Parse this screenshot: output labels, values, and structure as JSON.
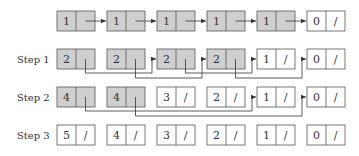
{
  "colors": {
    "shaded_fill": "#cfcfcf",
    "plain_fill": "#ffffff",
    "stroke": "#555555",
    "text": "#333333"
  },
  "layout": {
    "box_x": [
      57,
      107,
      157,
      207,
      257,
      307
    ],
    "box_width": 38,
    "box_height": 20,
    "row_y": [
      11,
      49,
      87,
      125
    ],
    "label_x": 17
  },
  "rows": [
    {
      "label": "",
      "nodes": [
        {
          "value": "1",
          "shaded": true,
          "null_ptr": false
        },
        {
          "value": "1",
          "shaded": true,
          "null_ptr": false
        },
        {
          "value": "1",
          "shaded": true,
          "null_ptr": false
        },
        {
          "value": "1",
          "shaded": true,
          "null_ptr": false
        },
        {
          "value": "1",
          "shaded": true,
          "null_ptr": false
        },
        {
          "value": "0",
          "shaded": false,
          "null_ptr": true
        }
      ],
      "links": [
        {
          "from": 0,
          "to": 1,
          "style": "straight"
        },
        {
          "from": 1,
          "to": 2,
          "style": "straight"
        },
        {
          "from": 2,
          "to": 3,
          "style": "straight"
        },
        {
          "from": 3,
          "to": 4,
          "style": "straight"
        },
        {
          "from": 4,
          "to": 5,
          "style": "straight"
        }
      ]
    },
    {
      "label": "Step 1",
      "nodes": [
        {
          "value": "2",
          "shaded": true,
          "null_ptr": false
        },
        {
          "value": "2",
          "shaded": true,
          "null_ptr": false
        },
        {
          "value": "2",
          "shaded": true,
          "null_ptr": false
        },
        {
          "value": "2",
          "shaded": true,
          "null_ptr": false
        },
        {
          "value": "1",
          "shaded": false,
          "null_ptr": true
        },
        {
          "value": "0",
          "shaded": false,
          "null_ptr": true
        }
      ],
      "links": [
        {
          "from": 0,
          "to": 2,
          "style": "below",
          "depth": 1
        },
        {
          "from": 1,
          "to": 3,
          "style": "below",
          "depth": 2
        },
        {
          "from": 2,
          "to": 4,
          "style": "below",
          "depth": 1
        },
        {
          "from": 3,
          "to": 5,
          "style": "below",
          "depth": 2
        }
      ]
    },
    {
      "label": "Step 2",
      "nodes": [
        {
          "value": "4",
          "shaded": true,
          "null_ptr": false
        },
        {
          "value": "4",
          "shaded": true,
          "null_ptr": false
        },
        {
          "value": "3",
          "shaded": false,
          "null_ptr": true
        },
        {
          "value": "2",
          "shaded": false,
          "null_ptr": true
        },
        {
          "value": "1",
          "shaded": false,
          "null_ptr": true
        },
        {
          "value": "0",
          "shaded": false,
          "null_ptr": true
        }
      ],
      "links": [
        {
          "from": 0,
          "to": 4,
          "style": "below",
          "depth": 1
        },
        {
          "from": 1,
          "to": 5,
          "style": "below",
          "depth": 2
        }
      ]
    },
    {
      "label": "Step 3",
      "nodes": [
        {
          "value": "5",
          "shaded": false,
          "null_ptr": true
        },
        {
          "value": "4",
          "shaded": false,
          "null_ptr": true
        },
        {
          "value": "3",
          "shaded": false,
          "null_ptr": true
        },
        {
          "value": "2",
          "shaded": false,
          "null_ptr": true
        },
        {
          "value": "1",
          "shaded": false,
          "null_ptr": true
        },
        {
          "value": "0",
          "shaded": false,
          "null_ptr": true
        }
      ],
      "links": []
    }
  ],
  "null_symbol": "/"
}
